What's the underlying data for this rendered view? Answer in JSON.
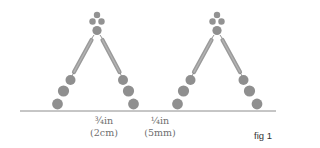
{
  "figure": {
    "label": "fig 1",
    "colors": {
      "bead": "#8f8f8f",
      "tube": "#9a9a9a",
      "baseline": "#8c8c8c",
      "label_text": "#6e6e6e"
    },
    "measurements": [
      {
        "line1": "¾in",
        "line2": "(2cm)"
      },
      {
        "line1": "¼in",
        "line2": "(5mm)"
      }
    ],
    "motifs": [
      {
        "name": "left-motif",
        "apex_x": 97
      },
      {
        "name": "right-motif",
        "apex_x": 217
      }
    ]
  }
}
